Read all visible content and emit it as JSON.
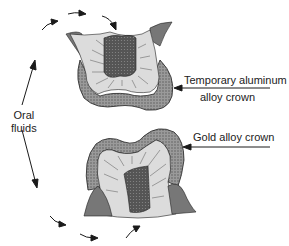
{
  "figure": {
    "labels": {
      "oral_fluids_line1": "Oral",
      "oral_fluids_line2": "fluids",
      "temporary_crown_line1": "Temporary aluminum",
      "temporary_crown_line2": "alloy crown",
      "gold_crown": "Gold alloy crown"
    },
    "colors": {
      "crown_fill": "#8a8a8a",
      "dentin_fill": "#d8d8d8",
      "pulp_fill": "#4a4a4a",
      "gum_fill": "#7a7a7a",
      "line": "#1a1a1a"
    }
  }
}
